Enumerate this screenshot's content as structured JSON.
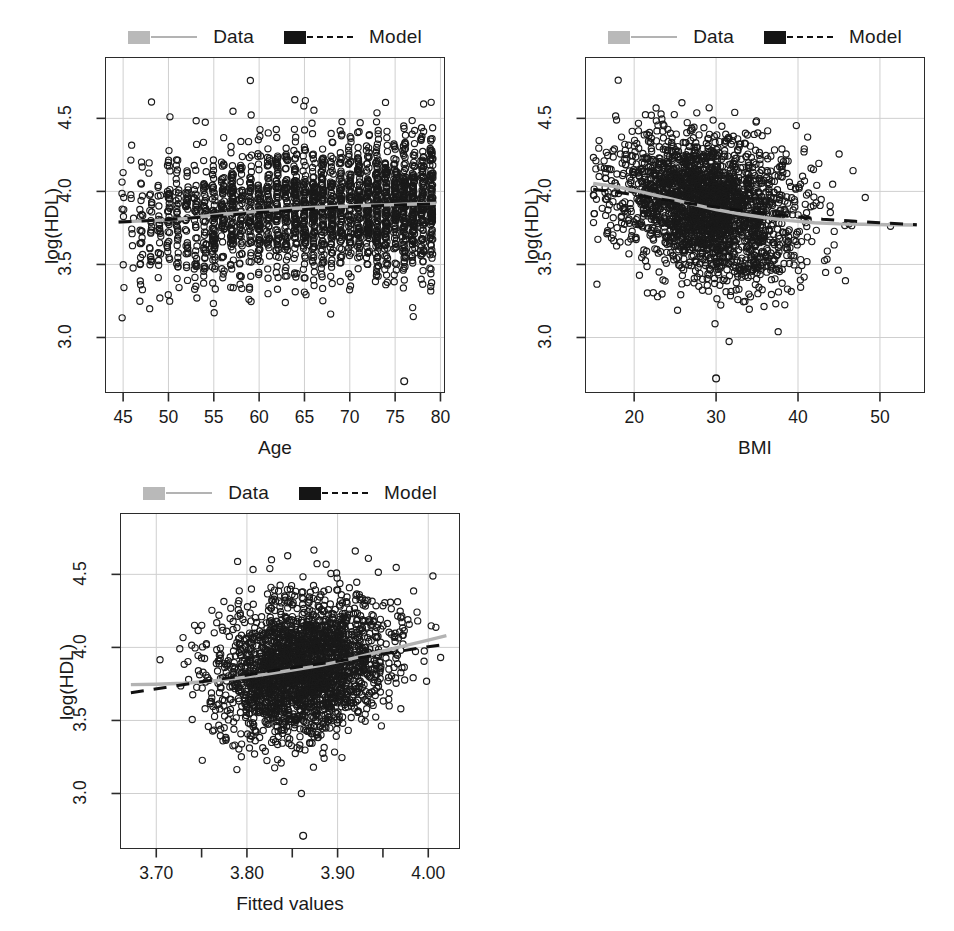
{
  "figure": {
    "background": "#ffffff",
    "panel_count": 3,
    "layout": "2x2 grid, bottom-right empty"
  },
  "legend": {
    "data_label": "Data",
    "model_label": "Model",
    "data_color": "#b3b3b3",
    "model_color": "#111111",
    "data_style": "solid",
    "model_style": "dashed"
  },
  "chart_data": [
    {
      "type": "scatter",
      "id": "panel-age",
      "title": "",
      "xlabel": "Age",
      "ylabel": "log(HDL)",
      "xlim": [
        43.0,
        80.5
      ],
      "ylim": [
        2.62,
        4.92
      ],
      "xticks": [
        45,
        50,
        55,
        60,
        65,
        70,
        75,
        80
      ],
      "xticklabels": [
        "45",
        "50",
        "55",
        "60",
        "65",
        "70",
        "75",
        "80"
      ],
      "yticks": [
        3.0,
        3.5,
        4.0,
        4.5
      ],
      "yticklabels": [
        "3.0",
        "3.5",
        "4.0",
        "4.5"
      ],
      "grid": true,
      "legend_position": "above plot, centered",
      "series": [
        {
          "name": "Data",
          "type": "line",
          "color": "#b3b3b3",
          "style": "solid",
          "x": [
            44.5,
            46,
            48,
            50,
            52,
            54,
            56,
            58,
            60,
            62,
            64,
            66,
            68,
            70,
            72,
            74,
            76,
            78,
            79.5
          ],
          "y": [
            3.79,
            3.795,
            3.8,
            3.805,
            3.815,
            3.83,
            3.845,
            3.855,
            3.865,
            3.875,
            3.885,
            3.89,
            3.895,
            3.9,
            3.905,
            3.908,
            3.912,
            3.915,
            3.918
          ]
        },
        {
          "name": "Model",
          "type": "line",
          "color": "#111111",
          "style": "dashed",
          "x": [
            44.5,
            48,
            52,
            56,
            60,
            64,
            68,
            72,
            76,
            79.5
          ],
          "y": [
            3.79,
            3.8,
            3.815,
            3.835,
            3.855,
            3.872,
            3.888,
            3.9,
            3.908,
            3.915
          ]
        },
        {
          "name": "Observations",
          "type": "scatter",
          "marker": "open-circle",
          "color": "#1a1a1a",
          "n_points": 2400,
          "x_range": [
            44.5,
            79.5
          ],
          "y_range": [
            2.68,
            4.88
          ],
          "note": "dense vertical striping at integer ages; sparse below age 50"
        }
      ]
    },
    {
      "type": "scatter",
      "id": "panel-bmi",
      "title": "",
      "xlabel": "BMI",
      "ylabel": "log(HDL)",
      "xlim": [
        14.0,
        55.5
      ],
      "ylim": [
        2.62,
        4.92
      ],
      "xticks": [
        20,
        30,
        40,
        50
      ],
      "xticklabels": [
        "20",
        "30",
        "40",
        "50"
      ],
      "yticks": [
        3.0,
        3.5,
        4.0,
        4.5
      ],
      "yticklabels": [
        "3.0",
        "3.5",
        "4.0",
        "4.5"
      ],
      "grid": true,
      "legend_position": "above plot, centered",
      "series": [
        {
          "name": "Data",
          "type": "line",
          "color": "#b3b3b3",
          "style": "solid",
          "x": [
            15,
            18,
            21,
            24,
            27,
            30,
            33,
            36,
            39,
            42,
            45,
            48,
            51,
            54.5
          ],
          "y": [
            4.055,
            4.03,
            3.995,
            3.955,
            3.915,
            3.875,
            3.845,
            3.82,
            3.8,
            3.785,
            3.778,
            3.775,
            3.772,
            3.77
          ]
        },
        {
          "name": "Model",
          "type": "line",
          "color": "#111111",
          "style": "dashed",
          "x": [
            15,
            19,
            23,
            27,
            31,
            35,
            39,
            43,
            47,
            51,
            54.5
          ],
          "y": [
            4.015,
            3.985,
            3.95,
            3.915,
            3.885,
            3.855,
            3.83,
            3.81,
            3.795,
            3.782,
            3.772
          ]
        },
        {
          "name": "Observations",
          "type": "scatter",
          "marker": "open-circle",
          "color": "#1a1a1a",
          "n_points": 2400,
          "x_range": [
            15,
            54.5
          ],
          "y_range": [
            2.7,
            4.85
          ],
          "note": "dense blob centred near BMI 22-38; long right tail"
        }
      ]
    },
    {
      "type": "scatter",
      "id": "panel-fitted",
      "title": "",
      "xlabel": "Fitted values",
      "ylabel": "log(HDL)",
      "xlim": [
        3.66,
        4.035
      ],
      "ylim": [
        2.62,
        4.92
      ],
      "xticks": [
        3.7,
        3.8,
        3.9,
        4.0
      ],
      "xticklabels": [
        "3.70",
        "3.80",
        "3.90",
        "4.00"
      ],
      "xminorticks": [
        3.75,
        3.85,
        3.95
      ],
      "yticks": [
        3.0,
        3.5,
        4.0,
        4.5
      ],
      "yticklabels": [
        "3.0",
        "3.5",
        "4.0",
        "4.5"
      ],
      "grid": true,
      "legend_position": "above plot, centered",
      "series": [
        {
          "name": "Data",
          "type": "line",
          "color": "#b3b3b3",
          "style": "solid",
          "x": [
            3.672,
            3.7,
            3.73,
            3.76,
            3.79,
            3.82,
            3.85,
            3.88,
            3.91,
            3.94,
            3.97,
            4.0,
            4.02
          ],
          "y": [
            3.745,
            3.748,
            3.755,
            3.768,
            3.79,
            3.815,
            3.845,
            3.875,
            3.915,
            3.96,
            4.005,
            4.05,
            4.08
          ]
        },
        {
          "name": "Model",
          "type": "line",
          "color": "#111111",
          "style": "dashed",
          "x": [
            3.672,
            3.71,
            3.75,
            3.79,
            3.83,
            3.87,
            3.91,
            3.95,
            3.99,
            4.02
          ],
          "y": [
            3.69,
            3.725,
            3.765,
            3.8,
            3.842,
            3.878,
            3.915,
            3.955,
            3.995,
            4.022
          ]
        },
        {
          "name": "Observations",
          "type": "scatter",
          "marker": "open-circle",
          "color": "#1a1a1a",
          "n_points": 2400,
          "x_range": [
            3.672,
            4.02
          ],
          "y_range": [
            2.7,
            4.87
          ],
          "note": "dense elliptical cloud centred near fitted 3.86"
        }
      ]
    }
  ]
}
